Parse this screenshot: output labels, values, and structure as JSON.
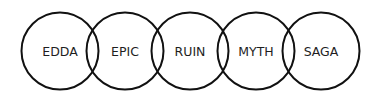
{
  "diagram": {
    "type": "overlapping-circles",
    "stroke_color": "#111111",
    "fill_color": "#ffffff",
    "circles": [
      {
        "label": "EDDA",
        "cx": 60,
        "cy": 51,
        "r": 38.5
      },
      {
        "label": "EPIC",
        "cx": 125,
        "cy": 51,
        "r": 38.5
      },
      {
        "label": "RUIN",
        "cx": 190,
        "cy": 51,
        "r": 38.5
      },
      {
        "label": "MYTH",
        "cx": 256,
        "cy": 51,
        "r": 38.5
      },
      {
        "label": "SAGA",
        "cx": 321,
        "cy": 51,
        "r": 38.5
      }
    ]
  }
}
